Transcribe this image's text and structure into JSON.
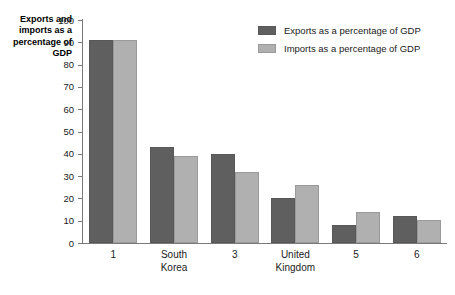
{
  "chart_data": {
    "type": "bar",
    "title": "",
    "xlabel": "",
    "ylabel": "Exports and imports as a percentage of GDP",
    "ylabel_lines": [
      "Exports and",
      "imports as a",
      "percentage of",
      "GDP"
    ],
    "ylim": [
      0,
      100
    ],
    "ytick_labels": [
      "100",
      "90",
      "80",
      "70",
      "60",
      "50",
      "40",
      "30",
      "20",
      "10",
      "0"
    ],
    "ytick_values": [
      100,
      90,
      80,
      70,
      60,
      50,
      40,
      30,
      20,
      10,
      0
    ],
    "grid": false,
    "legend_position": "top-right",
    "categories": [
      "1",
      "South Korea",
      "3",
      "United Kingdom",
      "5",
      "6"
    ],
    "category_lines": [
      [
        "1"
      ],
      [
        "South",
        "Korea"
      ],
      [
        "3"
      ],
      [
        "United",
        "Kingdom"
      ],
      [
        "5"
      ],
      [
        "6"
      ]
    ],
    "series": [
      {
        "name": "Exports as a percentage of GDP",
        "color": "#5f5f5f",
        "values": [
          91,
          43,
          40,
          20,
          8,
          12
        ]
      },
      {
        "name": "Imports as a percentage of GDP",
        "color": "#b0b0b0",
        "values": [
          91,
          39,
          32,
          26,
          14,
          10.5
        ]
      }
    ]
  },
  "colors": {
    "exports": "#5f5f5f",
    "imports": "#b0b0b0",
    "axis": "#7a7a7a",
    "text": "#1a1a1a",
    "background": "#ffffff"
  }
}
